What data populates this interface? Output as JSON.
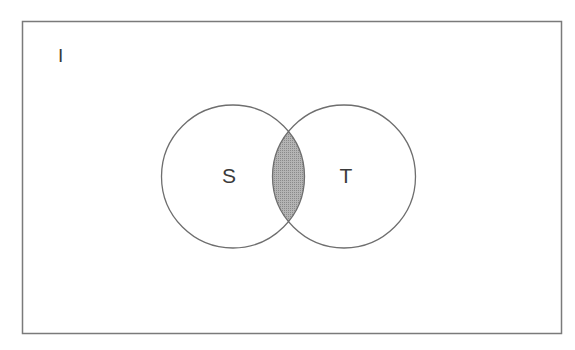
{
  "diagram": {
    "type": "venn",
    "universe": {
      "label": "I"
    },
    "sets": [
      {
        "id": "S",
        "label": "S"
      },
      {
        "id": "T",
        "label": "T"
      }
    ],
    "shaded_region": "S ∩ T",
    "colors": {
      "stroke": "#6e6e6e",
      "frame": "#7a7a7a",
      "shade": "#a9a9a9",
      "background": "#ffffff"
    }
  }
}
